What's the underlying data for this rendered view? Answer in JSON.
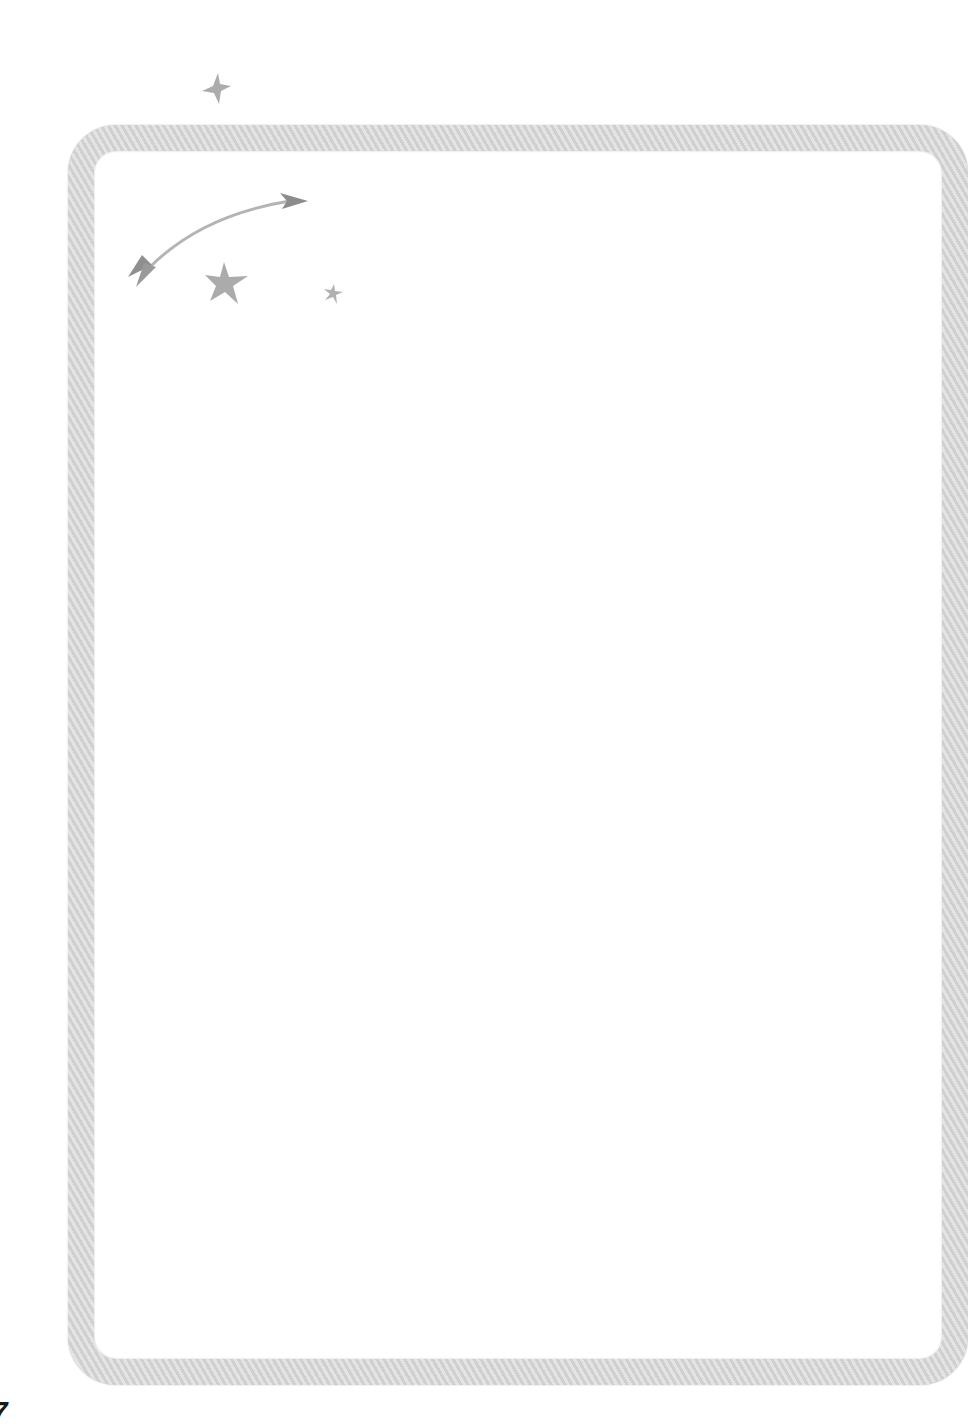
{
  "page": {
    "number": "7",
    "frame_color": "#d6d6d6",
    "decoration_color": "#a9a9a9",
    "arrow_color": "#8a8a8a"
  },
  "decorations": {
    "icons": [
      "star-icon",
      "arrow-icon",
      "star-icon",
      "star-icon"
    ]
  }
}
